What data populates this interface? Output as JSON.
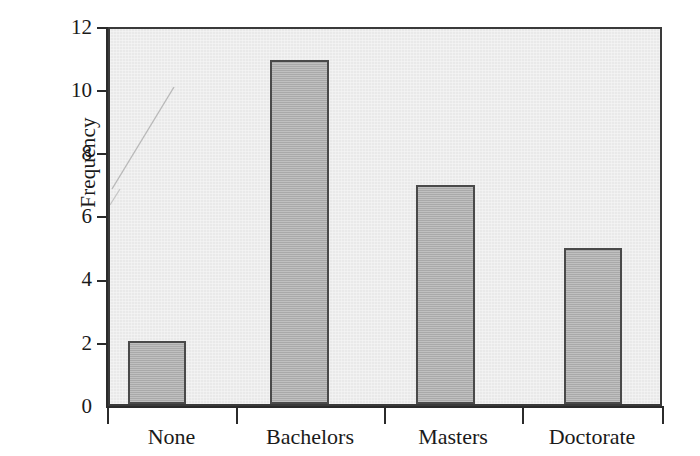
{
  "chart_data": {
    "type": "bar",
    "title": "",
    "xlabel": "",
    "ylabel": "Frequency",
    "categories": [
      "None",
      "Bachelors",
      "Masters",
      "Doctorate"
    ],
    "values": [
      2,
      11,
      7,
      5
    ],
    "ylim": [
      0,
      12
    ],
    "yticks": [
      0,
      2,
      4,
      6,
      8,
      10,
      12
    ],
    "ytick_labels": [
      "0",
      "2",
      "4",
      "6",
      "8",
      "10",
      "12"
    ],
    "grid": false,
    "legend": null,
    "legend_position": "none",
    "bar_fill_color": "#b2b2b2",
    "bar_edge_color": "#4a4a4a",
    "plot_background_color": "#e9e9e9",
    "axis_color": "#2b2b2b",
    "text_color": "#1a1a1a",
    "annotations": []
  },
  "axes": {
    "y_title": "Frequency"
  }
}
